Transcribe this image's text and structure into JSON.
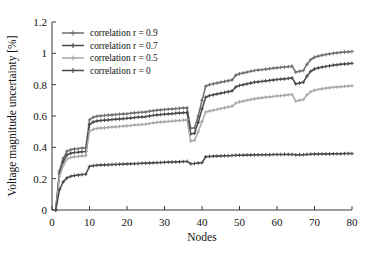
{
  "chart_data": {
    "type": "line",
    "title": "",
    "xlabel": "Nodes",
    "ylabel": "Voltage magnitude uncertainty [%]",
    "xlim": [
      0,
      80
    ],
    "ylim": [
      0,
      1.2
    ],
    "grid": false,
    "legend_position": "top-left inside",
    "xticks": [
      "0",
      "10",
      "20",
      "30",
      "40",
      "50",
      "60",
      "70",
      "80"
    ],
    "xtick_values": [
      0,
      10,
      20,
      30,
      40,
      50,
      60,
      70,
      80
    ],
    "yticks": [
      "0",
      "0.2",
      "0.4",
      "0.6",
      "0.8",
      "1",
      "1.2"
    ],
    "ytick_values": [
      0,
      0.2,
      0.4,
      0.6,
      0.8,
      1,
      1.2
    ],
    "marker": "plus",
    "x": [
      1,
      2,
      3,
      4,
      5,
      6,
      7,
      8,
      9,
      10,
      11,
      12,
      13,
      14,
      15,
      16,
      17,
      18,
      19,
      20,
      21,
      22,
      23,
      24,
      25,
      26,
      27,
      28,
      29,
      30,
      31,
      32,
      33,
      34,
      35,
      36,
      37,
      38,
      39,
      40,
      41,
      42,
      43,
      44,
      45,
      46,
      47,
      48,
      49,
      50,
      51,
      52,
      53,
      54,
      55,
      56,
      57,
      58,
      59,
      60,
      61,
      62,
      63,
      64,
      65,
      66,
      67,
      68,
      69,
      70,
      71,
      72,
      73,
      74,
      75,
      76,
      77,
      78,
      79,
      80
    ],
    "series": [
      {
        "name": "correlation r = 0.9",
        "color": "#6e6e6e",
        "values": [
          0.0,
          0.25,
          0.33,
          0.375,
          0.385,
          0.39,
          0.392,
          0.395,
          0.397,
          0.575,
          0.592,
          0.598,
          0.601,
          0.603,
          0.605,
          0.607,
          0.609,
          0.611,
          0.613,
          0.615,
          0.617,
          0.62,
          0.622,
          0.624,
          0.626,
          0.63,
          0.634,
          0.637,
          0.639,
          0.641,
          0.643,
          0.645,
          0.647,
          0.649,
          0.651,
          0.653,
          0.52,
          0.525,
          0.6,
          0.7,
          0.79,
          0.8,
          0.805,
          0.81,
          0.815,
          0.82,
          0.825,
          0.83,
          0.86,
          0.87,
          0.875,
          0.88,
          0.885,
          0.89,
          0.893,
          0.896,
          0.899,
          0.902,
          0.905,
          0.908,
          0.91,
          0.912,
          0.915,
          0.918,
          0.88,
          0.885,
          0.89,
          0.93,
          0.96,
          0.975,
          0.982,
          0.988,
          0.992,
          0.996,
          1.0,
          1.003,
          1.006,
          1.008,
          1.01,
          1.012
        ]
      },
      {
        "name": "correlation r = 0.7",
        "color": "#4a4a4a",
        "values": [
          0.0,
          0.235,
          0.31,
          0.352,
          0.362,
          0.367,
          0.369,
          0.372,
          0.374,
          0.545,
          0.562,
          0.568,
          0.571,
          0.573,
          0.575,
          0.577,
          0.579,
          0.581,
          0.583,
          0.585,
          0.587,
          0.59,
          0.592,
          0.594,
          0.596,
          0.6,
          0.604,
          0.607,
          0.609,
          0.611,
          0.613,
          0.615,
          0.617,
          0.619,
          0.621,
          0.623,
          0.485,
          0.49,
          0.56,
          0.645,
          0.72,
          0.73,
          0.735,
          0.74,
          0.745,
          0.75,
          0.755,
          0.76,
          0.785,
          0.795,
          0.8,
          0.805,
          0.81,
          0.815,
          0.818,
          0.821,
          0.824,
          0.827,
          0.83,
          0.833,
          0.835,
          0.837,
          0.84,
          0.843,
          0.805,
          0.81,
          0.815,
          0.855,
          0.885,
          0.9,
          0.907,
          0.912,
          0.916,
          0.92,
          0.924,
          0.927,
          0.93,
          0.932,
          0.934,
          0.936
        ]
      },
      {
        "name": "correlation r = 0.5",
        "color": "#a8a8a8",
        "values": [
          0.0,
          0.215,
          0.285,
          0.325,
          0.335,
          0.34,
          0.342,
          0.345,
          0.347,
          0.5,
          0.515,
          0.52,
          0.523,
          0.525,
          0.527,
          0.529,
          0.531,
          0.533,
          0.535,
          0.537,
          0.539,
          0.542,
          0.544,
          0.546,
          0.548,
          0.552,
          0.556,
          0.559,
          0.561,
          0.563,
          0.565,
          0.567,
          0.569,
          0.571,
          0.573,
          0.575,
          0.44,
          0.445,
          0.5,
          0.565,
          0.625,
          0.632,
          0.637,
          0.642,
          0.647,
          0.652,
          0.657,
          0.662,
          0.682,
          0.69,
          0.695,
          0.7,
          0.705,
          0.71,
          0.713,
          0.716,
          0.719,
          0.722,
          0.725,
          0.728,
          0.73,
          0.732,
          0.735,
          0.738,
          0.695,
          0.7,
          0.705,
          0.735,
          0.755,
          0.765,
          0.77,
          0.774,
          0.777,
          0.78,
          0.783,
          0.785,
          0.787,
          0.789,
          0.791,
          0.793
        ]
      },
      {
        "name": "correlation r = 0",
        "color": "#4a4a4a",
        "values": [
          0.0,
          0.13,
          0.18,
          0.205,
          0.215,
          0.22,
          0.223,
          0.226,
          0.228,
          0.278,
          0.283,
          0.285,
          0.287,
          0.288,
          0.289,
          0.29,
          0.291,
          0.292,
          0.293,
          0.294,
          0.295,
          0.296,
          0.297,
          0.298,
          0.299,
          0.3,
          0.301,
          0.302,
          0.303,
          0.304,
          0.305,
          0.306,
          0.307,
          0.308,
          0.309,
          0.31,
          0.295,
          0.297,
          0.3,
          0.302,
          0.34,
          0.342,
          0.343,
          0.344,
          0.345,
          0.346,
          0.347,
          0.348,
          0.349,
          0.35,
          0.35,
          0.351,
          0.351,
          0.352,
          0.352,
          0.353,
          0.353,
          0.353,
          0.354,
          0.354,
          0.354,
          0.355,
          0.355,
          0.355,
          0.352,
          0.353,
          0.353,
          0.355,
          0.356,
          0.357,
          0.357,
          0.358,
          0.358,
          0.358,
          0.359,
          0.359,
          0.359,
          0.36,
          0.36,
          0.36
        ]
      }
    ]
  }
}
